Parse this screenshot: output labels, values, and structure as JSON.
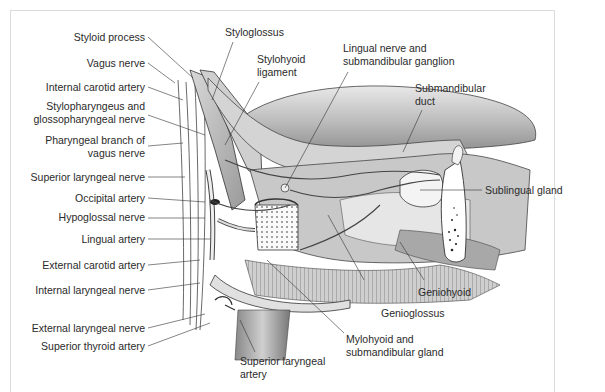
{
  "figure": {
    "labels_left": [
      {
        "id": "styloid-process",
        "text": "Styloid process"
      },
      {
        "id": "vagus-nerve",
        "text": "Vagus nerve"
      },
      {
        "id": "internal-carotid-artery",
        "text": "Internal carotid artery"
      },
      {
        "id": "stylopharyngeus",
        "text": "Stylopharyngeus and",
        "text2": "glossopharyngeal nerve"
      },
      {
        "id": "pharyngeal-branch",
        "text": "Pharyngeal branch of",
        "text2": "vagus nerve"
      },
      {
        "id": "superior-laryngeal-nerve",
        "text": "Superior laryngeal nerve"
      },
      {
        "id": "occipital-artery",
        "text": "Occipital artery"
      },
      {
        "id": "hypoglossal-nerve",
        "text": "Hypoglossal nerve"
      },
      {
        "id": "lingual-artery",
        "text": "Lingual artery"
      },
      {
        "id": "external-carotid-artery",
        "text": "External carotid artery"
      },
      {
        "id": "internal-laryngeal-nerve",
        "text": "Internal laryngeal nerve"
      },
      {
        "id": "external-laryngeal-nerve",
        "text": "External laryngeal nerve"
      },
      {
        "id": "superior-thyroid-artery",
        "text": "Superior thyroid artery"
      }
    ],
    "labels_top": [
      {
        "id": "styloglossus",
        "text": "Styloglossus"
      },
      {
        "id": "stylohyoid-ligament",
        "text": "Stylohyoid",
        "text2": "ligament"
      },
      {
        "id": "lingual-nerve",
        "text": "Lingual nerve and",
        "text2": "submandibular ganglion"
      },
      {
        "id": "submandibular-duct",
        "text": "Submandibular",
        "text2": "duct"
      }
    ],
    "labels_right": [
      {
        "id": "sublingual-gland",
        "text": "Sublingual gland"
      },
      {
        "id": "geniohyoid",
        "text": "Geniohyoid"
      },
      {
        "id": "genioglossus",
        "text": "Genioglossus"
      }
    ],
    "labels_bottom": [
      {
        "id": "mylohyoid",
        "text": "Mylohyoid and",
        "text2": "submandibular gland"
      },
      {
        "id": "superior-laryngeal-artery",
        "text": "Superior laryngeal",
        "text2": "artery"
      }
    ]
  }
}
